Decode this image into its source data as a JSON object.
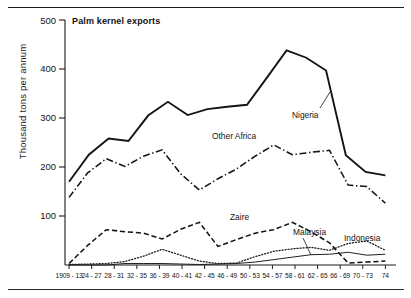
{
  "figure": {
    "title": "Palm kernel exports",
    "y_axis_title": "Thousand tons per annum",
    "y_ticks": [
      "100",
      "200",
      "300",
      "400",
      "500"
    ],
    "x_ticks": [
      "1909 - 13",
      "24 - 27",
      "28 - 31",
      "32 - 35",
      "36 - 39",
      "40 - 41",
      "42 - 45",
      "46 - 49",
      "50 - 53",
      "54 - 57",
      "58 - 61",
      "62 - 65",
      "66 - 69",
      "70 - 73",
      "74"
    ],
    "series_labels": {
      "nigeria": "Nigeria",
      "other_africa": "Other Africa",
      "zaire": "Zaire",
      "malaysia": "Malaysia",
      "indonesia": "Indonesia"
    }
  },
  "chart_data": {
    "type": "line",
    "title": "Palm kernel exports",
    "xlabel": "",
    "ylabel": "Thousand tons per annum",
    "ylim": [
      0,
      500
    ],
    "grid": false,
    "legend": "inline-labels",
    "categories": [
      "1909 - 13",
      "24 - 27",
      "28 - 31",
      "32 - 35",
      "36 - 39",
      "40 - 41",
      "42 - 45",
      "46 - 49",
      "50 - 53",
      "54 - 57",
      "58 - 61",
      "62 - 65",
      "66 - 69",
      "70 - 73",
      "74"
    ],
    "series": [
      {
        "name": "Nigeria",
        "style": "solid",
        "values": [
          170,
          225,
          258,
          253,
          305,
          333,
          306,
          318,
          323,
          327,
          382,
          438,
          423,
          397,
          224
        ]
      },
      {
        "name": "Other Africa",
        "style": "dash-dot",
        "values": [
          138,
          188,
          217,
          201,
          222,
          235,
          186,
          153,
          176,
          196,
          222,
          245,
          225,
          230,
          234
        ]
      },
      {
        "name": "Zaire",
        "style": "dashed",
        "values": [
          3,
          40,
          72,
          68,
          65,
          53,
          73,
          87,
          38,
          52,
          65,
          72,
          87,
          68,
          45
        ]
      },
      {
        "name": "Indonesia",
        "style": "dotted",
        "values": [
          1,
          2,
          3,
          7,
          18,
          32,
          20,
          8,
          3,
          4,
          17,
          28,
          33,
          36,
          30
        ]
      },
      {
        "name": "Malaysia",
        "style": "thin-solid",
        "values": [
          0,
          0,
          0,
          3,
          3,
          3,
          2,
          1,
          2,
          3,
          6,
          11,
          16,
          21,
          22
        ]
      }
    ],
    "series_extension_note": {
      "Nigeria": [
        190,
        183
      ],
      "Other Africa": [
        163,
        160,
        126
      ],
      "Zaire": [
        4,
        6,
        8
      ],
      "Indonesia": [
        44,
        49,
        30
      ],
      "Malaysia": [
        26,
        20,
        22
      ]
    }
  }
}
